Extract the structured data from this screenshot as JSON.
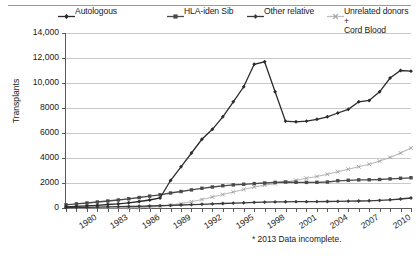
{
  "chart_data": {
    "type": "line",
    "title": "",
    "xlabel": "",
    "ylabel": "Transplants",
    "xlim": [
      1980,
      2013
    ],
    "ylim": [
      0,
      14000
    ],
    "ytick_labels": [
      "14,000",
      "12,000",
      "10,000",
      "8000",
      "6000",
      "4000",
      "2000",
      "0"
    ],
    "ytick_values": [
      14000,
      12000,
      10000,
      8000,
      6000,
      4000,
      2000,
      0
    ],
    "x": [
      1980,
      1981,
      1982,
      1983,
      1984,
      1985,
      1986,
      1987,
      1988,
      1989,
      1990,
      1991,
      1992,
      1993,
      1994,
      1995,
      1996,
      1997,
      1998,
      1999,
      2000,
      2001,
      2002,
      2003,
      2004,
      2005,
      2006,
      2007,
      2008,
      2009,
      2010,
      2011,
      2012,
      2013
    ],
    "xtick_labels": [
      "1980",
      "1983",
      "1986",
      "1989",
      "1992",
      "1995",
      "1998",
      "2001",
      "2004",
      "2007",
      "2010",
      "*2013"
    ],
    "xtick_values": [
      1980,
      1983,
      1986,
      1989,
      1992,
      1995,
      1998,
      2001,
      2004,
      2007,
      2010,
      2013
    ],
    "grid": true,
    "legend_position": "top",
    "series": [
      {
        "name": "Autologous",
        "color": "#2b2b2b",
        "marker": "diamond",
        "values": [
          100,
          130,
          170,
          220,
          280,
          340,
          420,
          520,
          640,
          800,
          2200,
          3300,
          4400,
          5500,
          6300,
          7300,
          8500,
          9700,
          11500,
          11700,
          9300,
          6950,
          6900,
          6950,
          7100,
          7300,
          7600,
          7900,
          8500,
          8600,
          9300,
          10400,
          11000,
          10950
        ]
      },
      {
        "name": "HLA-iden Sib",
        "color": "#4a4a4a",
        "marker": "square",
        "values": [
          260,
          330,
          400,
          480,
          560,
          640,
          740,
          840,
          950,
          1060,
          1200,
          1320,
          1450,
          1580,
          1680,
          1780,
          1850,
          1900,
          1950,
          2000,
          2050,
          2080,
          2060,
          2050,
          2060,
          2080,
          2180,
          2220,
          2250,
          2260,
          2280,
          2330,
          2380,
          2420
        ]
      },
      {
        "name": "Other relative",
        "color": "#3a3a3a",
        "marker": "diamond",
        "values": [
          40,
          50,
          60,
          75,
          90,
          105,
          120,
          140,
          160,
          185,
          210,
          240,
          270,
          300,
          330,
          360,
          390,
          420,
          450,
          470,
          490,
          500,
          505,
          510,
          515,
          520,
          530,
          545,
          560,
          580,
          610,
          660,
          720,
          800
        ]
      },
      {
        "name": "Unrelated donors + Cord Blood",
        "color": "#b8b8b8",
        "marker": "x",
        "values": [
          0,
          0,
          0,
          0,
          0,
          0,
          10,
          30,
          70,
          130,
          230,
          350,
          500,
          680,
          880,
          1080,
          1280,
          1480,
          1680,
          1830,
          1950,
          2080,
          2220,
          2380,
          2520,
          2700,
          2900,
          3100,
          3300,
          3500,
          3750,
          4050,
          4400,
          4800
        ]
      }
    ]
  },
  "legend": {
    "items": [
      {
        "label": "Autologous"
      },
      {
        "label": "HLA-iden Sib"
      },
      {
        "label": "Other relative"
      },
      {
        "label": "Unrelated donors +\nCord Blood"
      }
    ]
  },
  "footnote": "* 2013 Data incomplete."
}
